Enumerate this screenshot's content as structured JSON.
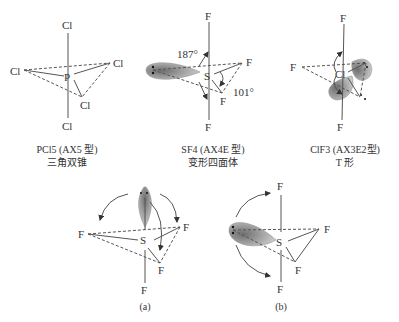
{
  "figures": [
    {
      "id": "pcl5",
      "atoms": {
        "center": "P",
        "ligands": [
          "Cl",
          "Cl",
          "Cl",
          "Cl",
          "Cl"
        ]
      },
      "caption_line1": "PCl5 (AX5 型)",
      "caption_line2": "三角双锥"
    },
    {
      "id": "sf4",
      "atoms": {
        "center": "S",
        "ligands": [
          "F",
          "F",
          "F",
          "F"
        ]
      },
      "angles": [
        "187°",
        "101°"
      ],
      "caption_line1": "SF4 (AX4E 型)",
      "caption_line2": "变形四面体"
    },
    {
      "id": "clf3",
      "atoms": {
        "center": "Cl",
        "ligands": [
          "F",
          "F",
          "F"
        ]
      },
      "caption_line1": "ClF3 (AX3E2型)",
      "caption_line2": "T 形"
    },
    {
      "id": "a",
      "atoms": {
        "center": "S",
        "ligands": [
          "F",
          "F",
          "F",
          "F"
        ]
      },
      "caption_line1": "(a)"
    },
    {
      "id": "b",
      "atoms": {
        "center": "S",
        "ligands": [
          "F",
          "F",
          "F",
          "F"
        ]
      },
      "caption_line1": "(b)"
    }
  ],
  "colors": {
    "line": "#444444",
    "lobe": "#9a9a9a",
    "text": "#333333"
  }
}
